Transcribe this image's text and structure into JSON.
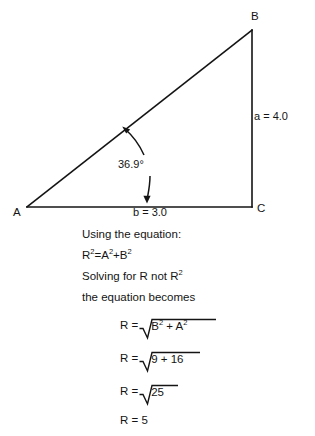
{
  "figure": {
    "type": "right-triangle-diagram",
    "vertices": [
      {
        "name": "A",
        "label": "A",
        "x": 27,
        "y": 207,
        "angle_deg": 53.1
      },
      {
        "name": "B",
        "label": "B",
        "x": 252,
        "y": 30,
        "angle_deg": 36.9
      },
      {
        "name": "C",
        "label": "C",
        "x": 252,
        "y": 207,
        "angle_deg": 90
      }
    ],
    "sides": {
      "vertical_label": "a = 4.0",
      "vertical_value": 4.0,
      "horizontal_label": "b = 3.0",
      "horizontal_value": 3.0
    },
    "angle": {
      "label": "36.9°",
      "value": 36.9,
      "at_vertex": "B",
      "marker": "double-headed-curved-arrow"
    },
    "line_color": "#141414"
  },
  "work": {
    "intro": "Using the equation:",
    "pythagorean": {
      "lhs": "R",
      "lhs_exp": "2",
      "eq": "=",
      "a": "A",
      "a_exp": "2",
      "plus": "+",
      "b": "B",
      "b_exp": "2"
    },
    "solving": {
      "text_before": "Solving for R not R",
      "exp": "2"
    },
    "becomes": "the equation becomes",
    "steps": [
      {
        "lhs": "R =",
        "radicand_parts": [
          {
            "base": "B",
            "exp": "2"
          },
          {
            "base": " + "
          },
          {
            "base": "A",
            "exp": "2"
          }
        ],
        "radicand_plain": "B2 + A2"
      },
      {
        "lhs": "R =",
        "radicand_parts": [
          {
            "base": "9 + 16"
          }
        ],
        "radicand_plain": "9 + 16"
      },
      {
        "lhs": "R =",
        "radicand_parts": [
          {
            "base": "25"
          }
        ],
        "radicand_plain": "25"
      }
    ],
    "result": "R = 5"
  }
}
